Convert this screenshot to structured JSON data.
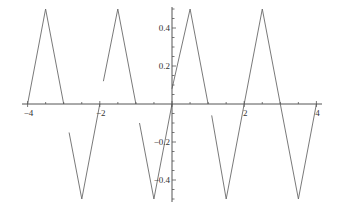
{
  "chart_data": {
    "type": "line",
    "title": "",
    "xlabel": "",
    "ylabel": "",
    "xlim": [
      -4,
      4.2
    ],
    "ylim": [
      -0.5,
      0.5
    ],
    "grid": false,
    "legend": null,
    "x_ticks": [
      -4,
      -2,
      2,
      4
    ],
    "x_tick_labels": [
      "-4",
      "-2",
      "2",
      "4"
    ],
    "x_minor_step": 0.5,
    "y_ticks": [
      -0.4,
      -0.2,
      0.2,
      0.4
    ],
    "y_tick_labels": [
      "-0.4",
      "-0.2",
      "0.2",
      "0.4"
    ],
    "y_minor_step": 0.05,
    "series": [
      {
        "name": "piecewise triangle wave",
        "color": "#6a6a6a",
        "segments": [
          [
            [
              -4,
              0
            ],
            [
              -3.5,
              0.5
            ],
            [
              -3,
              0
            ]
          ],
          [
            [
              -2.85,
              -0.15
            ],
            [
              -2.5,
              -0.5
            ],
            [
              -2,
              0
            ]
          ],
          [
            [
              -1.9,
              0.12
            ],
            [
              -1.5,
              0.5
            ],
            [
              -1,
              0
            ]
          ],
          [
            [
              -0.9,
              -0.1
            ],
            [
              -0.5,
              -0.5
            ],
            [
              0,
              0
            ]
          ],
          [
            [
              0,
              0.08
            ],
            [
              0.5,
              0.5
            ],
            [
              1,
              0
            ]
          ],
          [
            [
              1.1,
              -0.06
            ],
            [
              1.5,
              -0.5
            ],
            [
              2,
              0
            ]
          ],
          [
            [
              2,
              0
            ],
            [
              2.5,
              0.5
            ],
            [
              3,
              0
            ]
          ],
          [
            [
              3,
              0
            ],
            [
              3.5,
              -0.5
            ],
            [
              4,
              0
            ]
          ]
        ]
      }
    ]
  }
}
